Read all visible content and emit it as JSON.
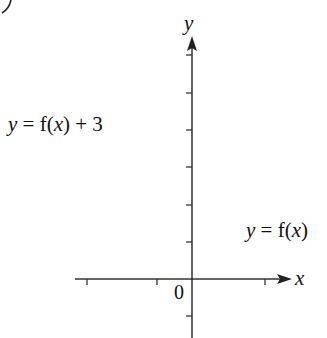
{
  "chart_data": {
    "type": "line",
    "title": "",
    "xlabel": "x",
    "ylabel": "y",
    "origin_label": "0",
    "grid": false,
    "xlim": [
      -3.2,
      2.7
    ],
    "ylim": [
      -1.6,
      6.5
    ],
    "x_ticks": [
      -3,
      -1,
      2
    ],
    "y_ticks": [
      -1,
      1,
      2,
      3,
      4,
      5,
      6
    ],
    "series": [
      {
        "name": "y = f(x)",
        "color": "#111111",
        "description": "cubic with roots near x=-2, 0, 1; local max ~(-1.1, 2.1), local min ~(0.55, -0.6)",
        "x": [
          -2.3,
          -2,
          -1.5,
          -1.1,
          -0.5,
          0,
          0.3,
          0.55,
          0.8,
          1,
          1.5,
          1.85
        ],
        "y": [
          -2.1,
          0,
          1.9,
          2.1,
          1.1,
          0,
          -0.4,
          -0.6,
          -0.45,
          0,
          2.6,
          6.3
        ]
      },
      {
        "name": "y = f(x) + 3",
        "color": "#777777",
        "description": "f(x) shifted up 3 units; local max ~(-1.1, 5.1), local min ~(0.55, 2.4), crosses y-axis at 3",
        "x": [
          -2.55,
          -2.3,
          -2,
          -1.5,
          -1.1,
          -0.5,
          0,
          0.3,
          0.55,
          0.8,
          1,
          1.5
        ],
        "y": [
          -1.7,
          0.9,
          3,
          4.9,
          5.1,
          4.1,
          3,
          2.6,
          2.4,
          2.55,
          3,
          5.6
        ]
      }
    ],
    "annotations": [
      {
        "text": "y = f(x) + 3",
        "position": "left of gray curve"
      },
      {
        "text": "y = f(x)",
        "position": "right of black curve"
      }
    ]
  },
  "labels": {
    "corner_fragment": ")",
    "y_axis": "y",
    "x_axis": "x",
    "origin": "0",
    "shifted_curve": {
      "y": "y",
      "eq": " = f(",
      "x": "x",
      "tail": ") + 3"
    },
    "base_curve": {
      "y": "y",
      "eq": " = f(",
      "x": "x",
      "tail": ")"
    }
  }
}
